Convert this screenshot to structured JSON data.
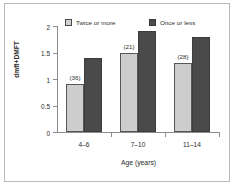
{
  "chart_data": {
    "type": "bar",
    "title": "",
    "subtitle": "",
    "xlabel": "Age (years)",
    "ylabel": "dmft+DMFT",
    "categories": [
      "4–6",
      "7–10",
      "11–14"
    ],
    "ylim": [
      0,
      2
    ],
    "yticks": [
      "0",
      "0.5",
      "1",
      "1.5",
      "2"
    ],
    "ytick_values": [
      0,
      0.5,
      1,
      1.5,
      2
    ],
    "grid": false,
    "legend_position": "top",
    "series": [
      {
        "name": "Twice or more",
        "values": [
          0.9,
          1.5,
          1.3
        ],
        "color": "#cdcdcd",
        "edge_color": "#565656"
      },
      {
        "name": "Once or less",
        "values": [
          1.4,
          1.9,
          1.8
        ],
        "color": "#4a4a4a",
        "edge_color": "#3c3c3c"
      }
    ],
    "annotations": [
      "(36)",
      "(21)",
      "(28)"
    ]
  }
}
